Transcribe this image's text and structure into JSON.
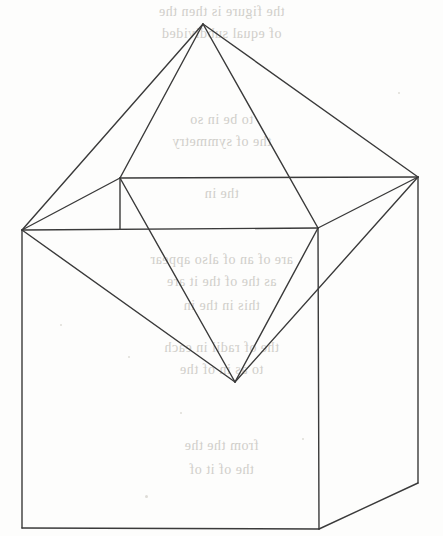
{
  "page": {
    "kind": "scanned-book-figure",
    "width": 443,
    "height": 536,
    "paper_color": "#fdfdfc",
    "ink_color": "#3a3a3a",
    "bleedthrough_color": "#c9c7c2",
    "caption": "",
    "title": "",
    "page_number": ""
  },
  "figure": {
    "name": "octahedron-on-cube",
    "stroke_color": "#3a3a3a",
    "stroke_width": 1.4,
    "fill": "none",
    "vertices": {
      "apex": {
        "label": "apex",
        "x": 203,
        "y": 24
      },
      "west": {
        "label": "left-vertex",
        "x": 22,
        "y": 230
      },
      "east": {
        "label": "right-vertex",
        "x": 418,
        "y": 177
      },
      "north": {
        "label": "back-left-vertex",
        "x": 120,
        "y": 178
      },
      "south": {
        "label": "front-right-vertex",
        "x": 318,
        "y": 228
      },
      "nadir": {
        "label": "bottom-vertex",
        "x": 235,
        "y": 382
      },
      "cube_bl": {
        "label": "cube-bottom-left",
        "x": 22,
        "y": 528
      },
      "cube_bf": {
        "label": "cube-bottom-front",
        "x": 319,
        "y": 529
      },
      "cube_br": {
        "label": "cube-bottom-right",
        "x": 418,
        "y": 483
      }
    },
    "edges": [
      {
        "name": "apex-to-west",
        "from": "apex",
        "to": "west"
      },
      {
        "name": "apex-to-north",
        "from": "apex",
        "to": "north"
      },
      {
        "name": "apex-to-south",
        "from": "apex",
        "to": "south"
      },
      {
        "name": "apex-to-east",
        "from": "apex",
        "to": "east"
      },
      {
        "name": "west-to-north",
        "from": "west",
        "to": "north"
      },
      {
        "name": "west-to-south",
        "from": "west",
        "to": "south"
      },
      {
        "name": "north-to-east",
        "from": "north",
        "to": "east"
      },
      {
        "name": "south-to-east",
        "from": "south",
        "to": "east"
      },
      {
        "name": "west-to-nadir",
        "from": "west",
        "to": "nadir"
      },
      {
        "name": "north-to-nadir",
        "from": "north",
        "to": "nadir"
      },
      {
        "name": "south-to-nadir",
        "from": "south",
        "to": "nadir"
      },
      {
        "name": "east-to-nadir",
        "from": "east",
        "to": "nadir"
      },
      {
        "name": "cube-top-back-edge",
        "from": "north",
        "to": "east"
      },
      {
        "name": "cube-top-left-edge",
        "from": "west",
        "to": "north"
      },
      {
        "name": "cube-top-front-edge",
        "from": "west",
        "to": "south"
      },
      {
        "name": "cube-top-right-edge",
        "from": "south",
        "to": "east"
      },
      {
        "name": "cube-vert-left",
        "from": "west",
        "to": "cube_bl"
      },
      {
        "name": "cube-vert-front",
        "from": "south",
        "to": "cube_bf"
      },
      {
        "name": "cube-vert-right",
        "from": "east",
        "to": "cube_br"
      },
      {
        "name": "cube-bottom-front",
        "from": "cube_bl",
        "to": "cube_bf"
      },
      {
        "name": "cube-bottom-right",
        "from": "cube_bf",
        "to": "cube_br"
      },
      {
        "name": "cube-hidden-vert",
        "from": "north",
        "to": "north_down"
      }
    ],
    "paths": {
      "octahedron_upper": "M 203,24 L 22,230 L 120,178 Z",
      "octahedron_full": "M 203,24 L 22,230 L 235,382 L 418,177 Z",
      "cube_top_face": "M 120,178 L 418,177 L 318,228 L 22,230 Z",
      "cube_left_face": "M 22,230 L 318,228 L 319,529 L 22,528 Z",
      "cube_right_face": "M 318,228 L 418,177 L 418,483 L 319,529 Z"
    },
    "hidden_edge": {
      "name": "north-vertical-stub",
      "x1": 120,
      "y1": 178,
      "x2": 120,
      "y2": 229
    }
  },
  "bleedthrough": {
    "note": "Faint mirror-image text showing through from the reverse side of the page; illegible in the scan.",
    "lines": [
      {
        "text": "the figure is then the",
        "top": 4,
        "size": 14
      },
      {
        "text": "of equal subdivided",
        "top": 26,
        "size": 14
      },
      {
        "text": "to be in so",
        "top": 112,
        "size": 14
      },
      {
        "text": "the of symmetry",
        "top": 134,
        "size": 14
      },
      {
        "text": "the in",
        "top": 186,
        "size": 14
      },
      {
        "text": "are of an of also appear",
        "top": 252,
        "size": 14
      },
      {
        "text": "as the  of the it are",
        "top": 274,
        "size": 14
      },
      {
        "text": "this in the in",
        "top": 298,
        "size": 14
      },
      {
        "text": "the of radii in each",
        "top": 340,
        "size": 14
      },
      {
        "text": "to as in of the",
        "top": 362,
        "size": 14
      },
      {
        "text": "from the the",
        "top": 438,
        "size": 14
      },
      {
        "text": "the  of  it  of",
        "top": 462,
        "size": 14
      }
    ]
  },
  "specks": [
    {
      "x": 180,
      "y": 412,
      "d": 2
    },
    {
      "x": 128,
      "y": 356,
      "d": 2
    },
    {
      "x": 302,
      "y": 438,
      "d": 2
    },
    {
      "x": 145,
      "y": 495,
      "d": 3
    },
    {
      "x": 398,
      "y": 92,
      "d": 2
    },
    {
      "x": 60,
      "y": 324,
      "d": 2
    }
  ]
}
